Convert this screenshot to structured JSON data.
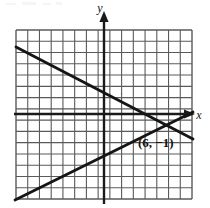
{
  "figure": {
    "kind": "coordinate-grid-graph",
    "background_color": "#ffffff",
    "ink_color": "#1a1a1a",
    "grid_line_color": "#5a5a5a"
  },
  "axes": {
    "x_label": "x",
    "y_label": "y",
    "x_axis_y_pixel": 114,
    "y_axis_x_pixel": 104,
    "cell_size_px": 11.4,
    "grid": {
      "left": 16,
      "top": 30,
      "right": 192,
      "bottom": 199,
      "columns": 15,
      "rows": 15,
      "show": true
    },
    "x_arrow": "right-arrow-icon",
    "y_arrow": "up-arrow-icon",
    "tick_labels_shown": false
  },
  "annotations": [
    {
      "name": "intersection-point-label",
      "text": "(6, −1)",
      "x_px": 138,
      "y_px": 146
    }
  ],
  "chart_data": {
    "type": "line",
    "title": "",
    "xlabel": "x",
    "ylabel": "y",
    "xlim": [
      -8,
      8
    ],
    "ylim": [
      -8,
      8
    ],
    "grid": true,
    "legend": false,
    "series": [
      {
        "name": "descending-line",
        "slope": -0.5,
        "intercept": 2,
        "points": [
          [
            -7.7,
            5.8
          ],
          [
            7.7,
            -2.1
          ]
        ],
        "pixel_points": [
          [
            16,
            48
          ],
          [
            192,
            138
          ]
        ]
      },
      {
        "name": "ascending-line",
        "slope": 0.6,
        "intercept": -4.6,
        "points": [
          [
            -7.7,
            -9.2
          ],
          [
            7.7,
            0.0
          ]
        ],
        "pixel_points": [
          [
            16,
            199
          ],
          [
            192,
            113
          ]
        ]
      }
    ],
    "annotations": [
      {
        "label": "(6, −1)",
        "x": 6,
        "y": -1,
        "pixel_x": 172,
        "pixel_y": 125
      }
    ]
  }
}
